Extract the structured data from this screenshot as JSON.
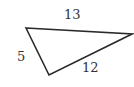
{
  "diagram": {
    "type": "triangle",
    "stroke_color": "#2a2a2a",
    "background": "#ffffff",
    "vertices": [
      {
        "name": "top-left",
        "x": 26,
        "y": 28
      },
      {
        "name": "right",
        "x": 132,
        "y": 34
      },
      {
        "name": "bottom",
        "x": 49,
        "y": 75
      }
    ],
    "sides": [
      {
        "label": "13",
        "between": [
          "top-left",
          "right"
        ]
      },
      {
        "label": "12",
        "between": [
          "right",
          "bottom"
        ]
      },
      {
        "label": "5",
        "between": [
          "bottom",
          "top-left"
        ]
      }
    ]
  }
}
